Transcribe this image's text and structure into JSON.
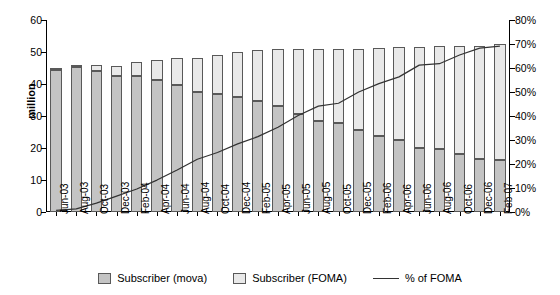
{
  "chart_data": {
    "type": "bar",
    "title": "",
    "subtitle": "",
    "xlabel": "",
    "ylabel": "million",
    "ylabel_right": "",
    "ylim": [
      0,
      60
    ],
    "ylim_right": [
      0,
      0.8
    ],
    "grid": false,
    "legend_position": "bottom",
    "stacked": true,
    "categories": [
      "Jun-03",
      "Jul-03",
      "Aug-03",
      "Sep-03",
      "Oct-03",
      "Nov-03",
      "Dec-03",
      "Jan-04",
      "Feb-04",
      "Mar-04",
      "Apr-04",
      "May-04",
      "Jun-04",
      "Jul-04",
      "Aug-04",
      "Sep-04",
      "Oct-04",
      "Nov-04",
      "Dec-04",
      "Jan-05",
      "Feb-05",
      "Mar-05",
      "Apr-05"
    ],
    "tick_labels": [
      "Jun-03",
      "Aug-03",
      "Oct-03",
      "Dec-03",
      "Feb-04",
      "Apr-04",
      "Jun-04",
      "Aug-04",
      "Oct-04",
      "Dec-04",
      "Feb-05",
      "Apr-05",
      "Jun-05",
      "Aug-05",
      "Oct-05",
      "Dec-05",
      "Feb-06",
      "Apr-06",
      "Jun-06",
      "Aug-06",
      "Oct-06",
      "Dec-06",
      "Feb-07"
    ],
    "x": [
      "Jun-03",
      "Aug-03",
      "Oct-03",
      "Dec-03",
      "Feb-04",
      "Apr-04",
      "Jun-04",
      "Aug-04",
      "Oct-04",
      "Dec-04",
      "Feb-05",
      "Apr-05",
      "Jun-05",
      "Aug-05",
      "Oct-05",
      "Dec-05",
      "Feb-06",
      "Apr-06",
      "Jun-06",
      "Aug-06",
      "Oct-06",
      "Dec-06",
      "Feb-07"
    ],
    "ytick_labels": [
      "0",
      "10",
      "20",
      "30",
      "40",
      "50",
      "60"
    ],
    "ytick_values": [
      0,
      10,
      20,
      30,
      40,
      50,
      60
    ],
    "ytick_labels_right": [
      "0%",
      "10%",
      "20%",
      "30%",
      "40%",
      "50%",
      "60%",
      "70%",
      "80%"
    ],
    "ytick_values_right": [
      0,
      10,
      20,
      30,
      40,
      50,
      60,
      70,
      80
    ],
    "series": [
      {
        "name": "Subscriber (mova)",
        "axis": "left",
        "color": "#c4c4c4",
        "values": [
          44.5,
          45.2,
          44.2,
          42.5,
          42.5,
          41.2,
          39.7,
          37.5,
          37.0,
          35.8,
          34.8,
          33.0,
          30.5,
          28.5,
          27.8,
          25.5,
          23.8,
          22.5,
          20.0,
          19.8,
          18.0,
          16.5,
          16.2
        ]
      },
      {
        "name": "Subscriber (FOMA)",
        "axis": "left",
        "color": "#e9e9e9",
        "values": [
          0.3,
          0.6,
          1.7,
          3.0,
          4.5,
          6.3,
          8.4,
          10.6,
          12.2,
          14.2,
          15.9,
          18.0,
          20.5,
          22.5,
          23.0,
          25.5,
          27.4,
          29.0,
          31.5,
          32.0,
          34.0,
          35.5,
          36.3
        ]
      },
      {
        "name": "% of FOMA",
        "axis": "right",
        "type": "line",
        "color": "#333333",
        "values": [
          0.7,
          1.3,
          3.7,
          6.6,
          9.6,
          13.3,
          17.5,
          22.0,
          24.8,
          28.4,
          31.4,
          35.3,
          40.2,
          44.1,
          45.3,
          50.0,
          53.5,
          56.3,
          61.2,
          61.8,
          65.4,
          68.3,
          69.1
        ]
      }
    ]
  },
  "axes": {
    "left_title": "million",
    "right_title": ""
  },
  "legend": {
    "items": [
      {
        "label": "Subscriber (mova)",
        "kind": "swatch",
        "color": "#c4c4c4",
        "icon": "square-swatch-icon"
      },
      {
        "label": "Subscriber (FOMA)",
        "kind": "swatch",
        "color": "#e9e9e9",
        "icon": "square-swatch-icon"
      },
      {
        "label": "% of FOMA",
        "kind": "line",
        "color": "#333333",
        "icon": "line-swatch-icon"
      }
    ]
  },
  "colors": {
    "mova": "#c4c4c4",
    "foma": "#e9e9e9",
    "line": "#333333",
    "border": "#595959",
    "axis": "#000000",
    "background": "#ffffff"
  }
}
